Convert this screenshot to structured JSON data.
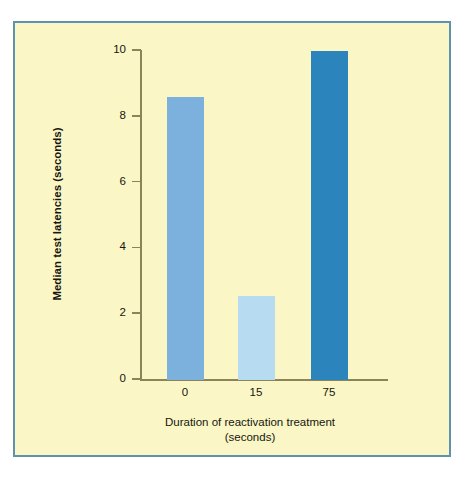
{
  "figure": {
    "background_color": "#faf6c6",
    "frame_color": "#5f93ad",
    "page_color": "#ffffff",
    "axis_color": "#8a8458"
  },
  "chart_data": {
    "type": "bar",
    "title": "",
    "subtitle": "",
    "xlabel": "Duration of reactivation treatment",
    "xlabel_line2": "(seconds)",
    "ylabel": "Median test latencies (seconds)",
    "categories": [
      "0",
      "15",
      "75"
    ],
    "values": [
      8.6,
      2.55,
      10.0
    ],
    "bar_colors": [
      "#7cb1de",
      "#b7dcf2",
      "#2b85bc"
    ],
    "ylim": [
      0,
      10
    ],
    "y_ticks": [
      0,
      2,
      4,
      6,
      8,
      10
    ],
    "y_tick_labels": [
      "0",
      "2",
      "4",
      "6",
      "8",
      "10"
    ],
    "x_tick_labels": [
      "0",
      "15",
      "75"
    ],
    "grid": false,
    "legend": null,
    "legend_position": "none",
    "annotations": []
  }
}
